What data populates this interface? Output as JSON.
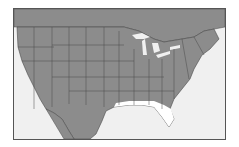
{
  "map": {
    "title": "",
    "region": "Contiguous United States",
    "colors": {
      "land": "#8c8c8c",
      "water": "#f0f0f0",
      "borders": "#4a4a4a",
      "highlight": "#ffffff",
      "frame": "#555555"
    },
    "highlighted_area": "Gulf Coast (Texas to Florida)"
  }
}
